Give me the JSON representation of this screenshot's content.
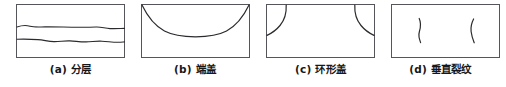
{
  "figure": {
    "type": "technical-illustration-row",
    "background_color": "#ffffff",
    "line_color": "#2b2b2f",
    "box_stroke_color": "#55555c",
    "panel_count": 4,
    "panels": [
      {
        "id": "a",
        "label": "(a)",
        "name_cn": "分层",
        "caption": "(a) 分层",
        "defect": "delamination",
        "box": {
          "x": 16,
          "y": 4,
          "width": 109,
          "height": 54
        },
        "features": [
          {
            "kind": "horizontal-wavy-crack",
            "y_fraction": 0.42
          },
          {
            "kind": "horizontal-wavy-crack",
            "y_fraction": 0.68
          }
        ]
      },
      {
        "id": "b",
        "label": "(b)",
        "name_cn": "端盖",
        "caption": "(b) 端盖",
        "defect": "end-cap",
        "box": {
          "x": 141,
          "y": 4,
          "width": 109,
          "height": 54
        },
        "features": [
          {
            "kind": "concave-arc-from-top-corners",
            "dip_fraction": 0.55
          }
        ]
      },
      {
        "id": "c",
        "label": "(c)",
        "name_cn": "环形盖",
        "caption": "(c) 环形盖",
        "defect": "ring-cap",
        "box": {
          "x": 266,
          "y": 4,
          "width": 109,
          "height": 54
        },
        "features": [
          {
            "kind": "corner-arc-top-left"
          },
          {
            "kind": "corner-arc-top-right"
          }
        ]
      },
      {
        "id": "d",
        "label": "(d)",
        "name_cn": "垂直裂纹",
        "caption": "(d) 垂直裂纹",
        "defect": "vertical-cracks",
        "box": {
          "x": 391,
          "y": 4,
          "width": 109,
          "height": 54
        },
        "features": [
          {
            "kind": "vertical-crack",
            "x_fraction": 0.27
          },
          {
            "kind": "vertical-crack",
            "x_fraction": 0.74
          }
        ]
      }
    ]
  }
}
